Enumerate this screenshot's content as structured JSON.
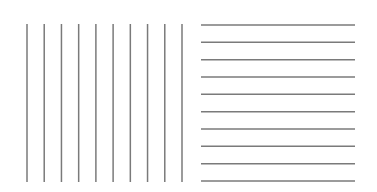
{
  "figure": {
    "width": 377,
    "height": 192,
    "background": "#ffffff",
    "line_color": "#7a7a7a",
    "line_width": 1.5
  },
  "panels": [
    {
      "name": "vertical-lines-panel",
      "orientation": "vertical",
      "count": 10,
      "x_start": 27,
      "x_end": 182,
      "y_top": 24,
      "y_bottom": 182
    },
    {
      "name": "horizontal-lines-panel",
      "orientation": "horizontal",
      "count": 10,
      "y_start": 25,
      "y_end": 181,
      "x_left": 201,
      "x_right": 355
    }
  ]
}
